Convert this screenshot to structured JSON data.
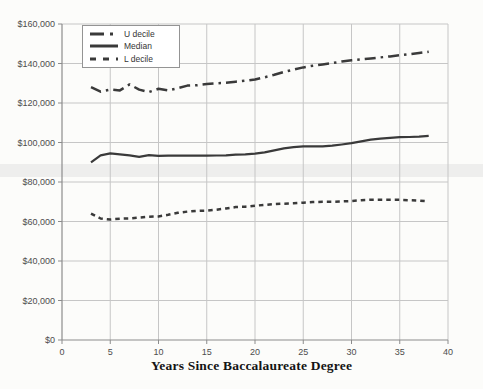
{
  "chart_data": {
    "type": "line",
    "title": "",
    "xlabel": "Years Since Baccalaureate Degree",
    "ylabel": "",
    "xlim": [
      0,
      40
    ],
    "ylim": [
      0,
      160000
    ],
    "x_tick_step": 5,
    "y_tick_step": 20000,
    "y_tick_prefix": "$",
    "grid": true,
    "legend_position": "top-left",
    "x": [
      3,
      4,
      5,
      6,
      7,
      8,
      9,
      10,
      11,
      12,
      13,
      14,
      15,
      16,
      17,
      18,
      19,
      20,
      21,
      22,
      23,
      24,
      25,
      26,
      27,
      28,
      29,
      30,
      31,
      32,
      33,
      34,
      35,
      36,
      37,
      38
    ],
    "series": [
      {
        "name": "U decile",
        "line_style": "dashdot",
        "values": [
          128000,
          125700,
          126800,
          126400,
          129400,
          126800,
          125500,
          127200,
          126400,
          127500,
          128800,
          129000,
          129600,
          130000,
          130300,
          130800,
          131300,
          131900,
          133000,
          134300,
          135700,
          136900,
          138000,
          138900,
          139500,
          140200,
          141000,
          141600,
          142100,
          142600,
          143100,
          143600,
          144200,
          144700,
          145300,
          146000
        ]
      },
      {
        "name": "Median",
        "line_style": "solid",
        "values": [
          90000,
          93500,
          94500,
          94000,
          93500,
          92700,
          93600,
          93200,
          93300,
          93400,
          93300,
          93300,
          93300,
          93400,
          93500,
          93800,
          94000,
          94400,
          95000,
          96000,
          97000,
          97600,
          98000,
          98100,
          98100,
          98400,
          99000,
          99700,
          100600,
          101400,
          102000,
          102400,
          102700,
          102800,
          103000,
          103400
        ]
      },
      {
        "name": "L decile",
        "line_style": "dashed",
        "values": [
          64000,
          61500,
          61000,
          61400,
          61500,
          62000,
          62400,
          62600,
          63400,
          64400,
          65000,
          65400,
          65500,
          66000,
          66600,
          67300,
          67500,
          68000,
          68400,
          68800,
          69000,
          69200,
          69500,
          69800,
          70000,
          70000,
          70200,
          70400,
          70800,
          71000,
          71000,
          71000,
          71000,
          70800,
          70600,
          70200
        ]
      }
    ],
    "line_color": "#3a3a3a",
    "grid_color": "#c6c6c6",
    "axis_color": "#8c8c8c",
    "tick_label_color": "#4d4d4d"
  }
}
